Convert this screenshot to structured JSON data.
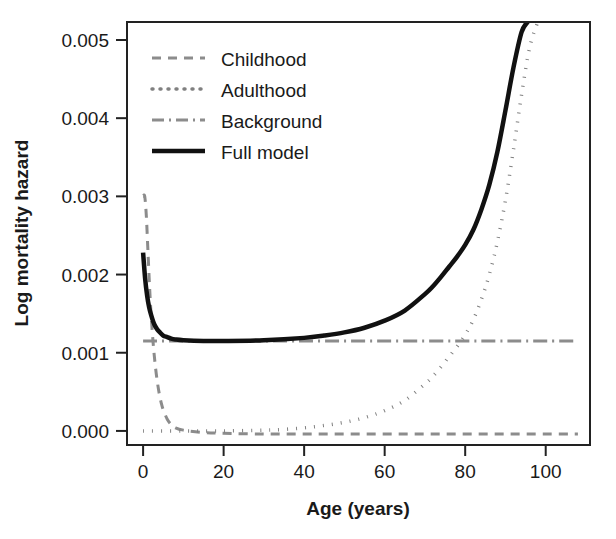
{
  "chart_data": {
    "type": "line",
    "title": "",
    "xlabel": "Age (years)",
    "ylabel": "Log mortality hazard",
    "xlim": [
      -4,
      111
    ],
    "ylim": [
      -0.00018,
      0.00523
    ],
    "xticks": [
      0,
      20,
      40,
      60,
      80,
      100
    ],
    "xtick_labels": [
      "0",
      "20",
      "40",
      "60",
      "80",
      "100"
    ],
    "yticks": [
      0.0,
      0.001,
      0.002,
      0.003,
      0.004,
      0.005
    ],
    "ytick_labels": [
      "0.000",
      "0.001",
      "0.002",
      "0.003",
      "0.004",
      "0.005"
    ],
    "grid": false,
    "legend_position": "top-left-inside",
    "series": [
      {
        "name": "Childhood",
        "style": "dashed",
        "color": "#8c8c8c",
        "width": 3,
        "dash": "9,7",
        "x": [
          0,
          0.4,
          0.8,
          1.2,
          1.6,
          2.0,
          2.5,
          3.0,
          3.5,
          4.0,
          4.5,
          5.0,
          6.0,
          7.0,
          8.0,
          10,
          15,
          20,
          30,
          40,
          50,
          60,
          70,
          80,
          90,
          100,
          108
        ],
        "y": [
          0.003,
          0.003,
          0.00275,
          0.0023,
          0.00185,
          0.00148,
          0.00112,
          0.00085,
          0.00064,
          0.00048,
          0.00036,
          0.00027,
          0.00015,
          8e-05,
          4e-05,
          1e-05,
          -2e-05,
          -3e-05,
          -4e-05,
          -4e-05,
          -4e-05,
          -4e-05,
          -4e-05,
          -4e-05,
          -4e-05,
          -4e-05,
          -4e-05
        ]
      },
      {
        "name": "Adulthood",
        "style": "dotted",
        "color": "#808080",
        "width": 3.5,
        "dash": "1,8",
        "x": [
          0,
          10,
          20,
          30,
          35,
          40,
          45,
          50,
          55,
          60,
          65,
          70,
          72,
          74,
          76,
          78,
          80,
          82,
          84,
          86,
          88,
          90,
          92,
          94,
          96,
          98
        ],
        "y": [
          0.0,
          0.0,
          0.0,
          1e-05,
          2e-05,
          4e-05,
          7e-05,
          0.00011,
          0.00017,
          0.00026,
          0.00039,
          0.0006,
          0.0007,
          0.00082,
          0.00095,
          0.00108,
          0.00123,
          0.00142,
          0.00168,
          0.002,
          0.00242,
          0.00295,
          0.0036,
          0.0043,
          0.0049,
          0.00523
        ]
      },
      {
        "name": "Background",
        "style": "dashdot",
        "color": "#8c8c8c",
        "width": 3,
        "dash": "14,5,2,5",
        "x": [
          0,
          108
        ],
        "y": [
          0.00115,
          0.00115
        ]
      },
      {
        "name": "Full model",
        "style": "solid",
        "color": "#111111",
        "width": 4.5,
        "dash": "",
        "x": [
          0,
          0.5,
          1,
          1.5,
          2,
          2.5,
          3,
          3.5,
          4,
          5,
          6,
          7,
          8,
          10,
          15,
          20,
          30,
          40,
          45,
          50,
          55,
          60,
          65,
          70,
          72,
          74,
          76,
          78,
          80,
          82,
          84,
          86,
          88,
          90,
          92,
          94,
          95.5
        ],
        "y": [
          0.00228,
          0.00195,
          0.00173,
          0.00158,
          0.00148,
          0.0014,
          0.00134,
          0.0013,
          0.00127,
          0.00122,
          0.0012,
          0.00118,
          0.00117,
          0.00116,
          0.00115,
          0.00115,
          0.00116,
          0.00119,
          0.00122,
          0.00126,
          0.00132,
          0.00141,
          0.00154,
          0.00175,
          0.00185,
          0.00197,
          0.0021,
          0.00223,
          0.00238,
          0.00257,
          0.00283,
          0.00315,
          0.00357,
          0.0041,
          0.00465,
          0.0051,
          0.00523
        ]
      }
    ],
    "legend": [
      {
        "label": "Childhood",
        "style": "dashed",
        "color": "#8c8c8c",
        "dash": "9,7",
        "width": 3
      },
      {
        "label": "Adulthood",
        "style": "dotted",
        "color": "#808080",
        "dash": "1,7",
        "width": 3.5
      },
      {
        "label": "Background",
        "style": "dashdot",
        "color": "#8c8c8c",
        "dash": "12,5,2,5",
        "width": 3
      },
      {
        "label": "Full model",
        "style": "solid",
        "color": "#111111",
        "dash": "",
        "width": 4.5
      }
    ]
  },
  "figure": {
    "background_color": "#ffffff",
    "frame_color": "#222222",
    "text_color": "#1a1a1a"
  }
}
